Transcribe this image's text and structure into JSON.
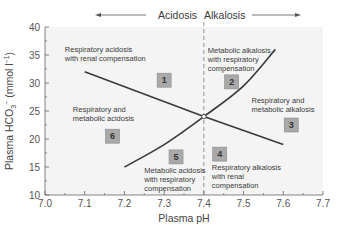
{
  "chart_data": {
    "type": "line",
    "title": "",
    "xlabel": "Plasma pH",
    "ylabel": "Plasma HCO3⁻ (mmol l⁻¹)",
    "ylabel_parts": {
      "main": "Plasma HCO",
      "sub": "3",
      "sup_ion": "−",
      "unit": " (mmol l",
      "unit_sup": "−1",
      "close": ")"
    },
    "xlim": [
      7.0,
      7.7
    ],
    "ylim": [
      10,
      40
    ],
    "x_ticks": [
      "7.0",
      "7.1",
      "7.2",
      "7.3",
      "7.4",
      "7.5",
      "7.6",
      "7.7"
    ],
    "x_tick_values": [
      7.0,
      7.1,
      7.2,
      7.3,
      7.4,
      7.5,
      7.6,
      7.7
    ],
    "y_ticks": [
      "10",
      "15",
      "20",
      "25",
      "30",
      "35",
      "40"
    ],
    "y_tick_values": [
      10,
      15,
      20,
      25,
      30,
      35,
      40
    ],
    "grid": false,
    "header": {
      "left_label": "Acidosis",
      "right_label": "Alkalosis"
    },
    "reference_line": {
      "x": 7.4,
      "style": "dashed"
    },
    "normal_point": {
      "x": 7.4,
      "y": 24
    },
    "series": [
      {
        "name": "respiratory-line",
        "x": [
          7.1,
          7.4,
          7.6
        ],
        "y": [
          32,
          24,
          19
        ]
      },
      {
        "name": "metabolic-curve",
        "x": [
          7.2,
          7.3,
          7.4,
          7.5,
          7.58
        ],
        "y": [
          15,
          19,
          24,
          29.5,
          36
        ]
      }
    ],
    "regions": [
      {
        "id": "1",
        "x": 7.3,
        "y": 30.5,
        "label": [
          "Respiratory acidosis",
          "with renal compensation"
        ],
        "label_x": 7.05,
        "label_y": 35.5
      },
      {
        "id": "2",
        "x": 7.47,
        "y": 30.2,
        "label": [
          "Metabolic alkalosis",
          "with respiratory",
          "compensation"
        ],
        "label_x": 7.41,
        "label_y": 35.3
      },
      {
        "id": "3",
        "x": 7.62,
        "y": 22.5,
        "label": [
          "Respiratory and",
          "metabolic alkalosis"
        ],
        "label_x": 7.52,
        "label_y": 26.5
      },
      {
        "id": "4",
        "x": 7.44,
        "y": 17.3,
        "label": [
          "Respiratory alkalosis",
          "with renal",
          "compensation"
        ],
        "label_x": 7.42,
        "label_y": 14.5
      },
      {
        "id": "5",
        "x": 7.33,
        "y": 16.8,
        "label": [
          "Metabolic acidosis",
          "with respiratory",
          "compensation"
        ],
        "label_x": 7.25,
        "label_y": 14.0
      },
      {
        "id": "6",
        "x": 7.17,
        "y": 20.5,
        "label": [
          "Respiratory and",
          "metabolic acidosis"
        ],
        "label_x": 7.07,
        "label_y": 24.8
      }
    ]
  },
  "colors": {
    "line": "#3a3a3a",
    "axis": "#666666",
    "box_fill": "#a9a9a9",
    "box_stroke": "#8a8a8a",
    "plot_bg": "#f3f3f3"
  }
}
